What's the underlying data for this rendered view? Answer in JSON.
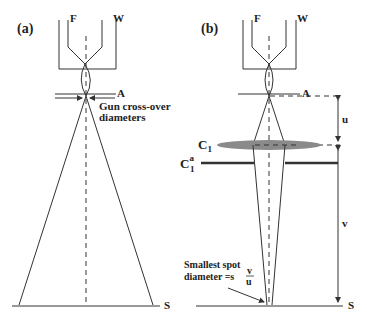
{
  "panels": {
    "a": {
      "label": "(a)",
      "filament_label": "F",
      "wehnelt_label": "W",
      "crossover_label": "A",
      "annotation_line1": "Gun cross-over",
      "annotation_line2": "diameters",
      "specimen_label": "S"
    },
    "b": {
      "label": "(b)",
      "filament_label": "F",
      "wehnelt_label": "W",
      "crossover_label": "A",
      "lens_label": "C",
      "lens_subscript": "1",
      "aperture_label": "C",
      "aperture_superscript": "a",
      "aperture_subscript": "1",
      "distance_u": "u",
      "distance_v": "v",
      "spot_line1": "Smallest spot",
      "spot_line2": "diameter =s",
      "fraction_num": "v",
      "fraction_den": "u",
      "specimen_label": "S"
    }
  },
  "colors": {
    "line": "#333333",
    "lens_fill": "#8a8a8a",
    "background": "#ffffff"
  }
}
